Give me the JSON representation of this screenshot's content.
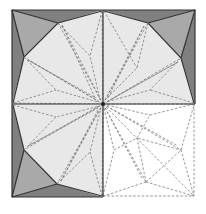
{
  "diagram": {
    "type": "origami crease pattern",
    "square": {
      "x0": 12,
      "y0": 10,
      "x1": 195,
      "y1": 197
    },
    "center": {
      "x": 103,
      "y": 104
    },
    "colors": {
      "paper_light": "#e8e8e8",
      "flap_medium": "#a9a9a9",
      "flap_dark": "#808080",
      "blank": "#ffffff",
      "valley_line": "#7a7a7a",
      "edge_line": "#333333"
    },
    "quadrants": [
      {
        "name": "top-left",
        "shaded": true
      },
      {
        "name": "top-right",
        "shaded": true
      },
      {
        "name": "bottom-left",
        "shaded": true
      },
      {
        "name": "bottom-right",
        "shaded": false
      }
    ]
  }
}
